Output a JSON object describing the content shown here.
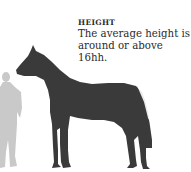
{
  "caption": {
    "title": "HEIGHT",
    "text_line1": "The average height is",
    "text_line2": "around or above 16hh."
  },
  "illustration": {
    "horse_color": "#3a3a3a",
    "human_color": "#c9c9c9",
    "subjects": [
      "human-silhouette",
      "horse-silhouette"
    ]
  }
}
